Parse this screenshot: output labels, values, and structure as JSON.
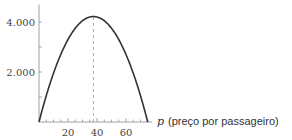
{
  "chart_data": {
    "type": "line",
    "title": "",
    "xlabel_var": "p",
    "xlabel": "(preço por passageiro)",
    "ylabel": "",
    "xlim": [
      0,
      78
    ],
    "ylim": [
      0,
      4700
    ],
    "x_ticks": [
      20,
      40,
      60
    ],
    "x_minor_step": 5,
    "y_ticks": [
      2000,
      4000
    ],
    "y_tick_labels": [
      "2.000",
      "4.000"
    ],
    "y_minor_ticks": [
      1000,
      3000
    ],
    "grid": false,
    "series": [
      {
        "name": "R(p)",
        "x": [
          0,
          5,
          10,
          15,
          20,
          25,
          30,
          35,
          37.5,
          40,
          45,
          50,
          55,
          60,
          65,
          70,
          75
        ],
        "values": [
          0,
          1050,
          1950,
          2700,
          3300,
          3750,
          4050,
          4200,
          4219,
          4200,
          4050,
          3750,
          3300,
          2700,
          1950,
          1050,
          0
        ]
      }
    ],
    "annotations": [
      {
        "type": "vline-dashed",
        "x": 37.5,
        "from": 0,
        "to": 4219
      }
    ],
    "colors": {
      "curve": "#333333",
      "axis": "#888888",
      "dash": "#999999"
    }
  }
}
